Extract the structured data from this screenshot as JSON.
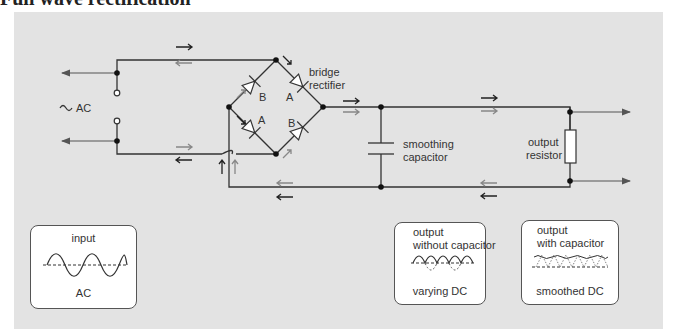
{
  "title": "Full wave rectification",
  "colors": {
    "panel_bg": "#e3e3e3",
    "wire": "#333333",
    "arrow_dark": "#222222",
    "arrow_light": "#888888",
    "box_bg": "#ffffff"
  },
  "circuit": {
    "source_label": "AC",
    "source_symbol": "~",
    "bridge_label_line1": "bridge",
    "bridge_label_line2": "rectifier",
    "diode_labels": [
      "B",
      "A",
      "A",
      "B"
    ],
    "capacitor_label_line1": "smoothing",
    "capacitor_label_line2": "capacitor",
    "resistor_label_line1": "output",
    "resistor_label_line2": "resistor"
  },
  "panels": [
    {
      "title_line1": "input",
      "title_line2": "",
      "caption": "AC",
      "wave": "sine"
    },
    {
      "title_line1": "output",
      "title_line2": "without capacitor",
      "caption": "varying DC",
      "wave": "rectified"
    },
    {
      "title_line1": "output",
      "title_line2": "with capacitor",
      "caption": "smoothed DC",
      "wave": "smoothed"
    }
  ]
}
